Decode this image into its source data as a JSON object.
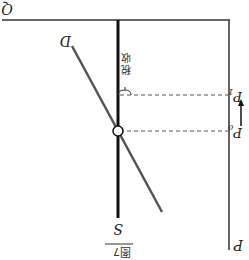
{
  "figure": {
    "caption": "图7",
    "orientation": "rotated-180",
    "axes": {
      "x_label": "Q",
      "y_label": "P"
    },
    "curves": {
      "supply_label": "S",
      "demand_label": "D"
    },
    "price_levels": {
      "p0_label": "P",
      "p0_sub": "0",
      "p1_label": "P",
      "p1_sub": "1"
    },
    "annotation": {
      "tax_label_line1": "税",
      "tax_label_line2": "收"
    },
    "colors": {
      "axis": "#333333",
      "supply": "#111111",
      "demand": "#555555",
      "dashed": "#555555"
    }
  }
}
